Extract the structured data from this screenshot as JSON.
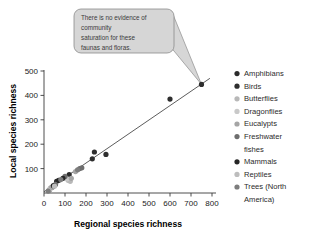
{
  "figure": {
    "background_color": "#ffffff"
  },
  "callout": {
    "name": "annotation-callout",
    "lines": [
      "There is no evidence of",
      "community",
      "saturation for these",
      "faunas and floras."
    ],
    "text": "There is no evidence of community saturation for these faunas and floras.",
    "fill_color": "#d6d6d6",
    "border_color": "#8c8c8c",
    "text_color": "#3a3a3a",
    "points_to": {
      "x": 750,
      "y": 445
    }
  },
  "chart_data": {
    "type": "scatter",
    "title": "",
    "xlabel": "Regional species richness",
    "ylabel": "Local species richness",
    "xlim": [
      0,
      800
    ],
    "ylim": [
      0,
      500
    ],
    "xticks": [
      0,
      100,
      200,
      300,
      400,
      500,
      600,
      700,
      800
    ],
    "xtick_labels": [
      "0",
      "100",
      "200",
      "300",
      "400",
      "500",
      "600",
      "700",
      "800"
    ],
    "yticks": [
      100,
      200,
      300,
      400,
      500
    ],
    "ytick_labels": [
      "100",
      "200",
      "300",
      "400",
      "500"
    ],
    "grid": false,
    "legend_position": "right",
    "trendline": {
      "name": "regression-line",
      "color": "#4a4a4a",
      "x_start": 0,
      "y_start": 5,
      "x_end": 790,
      "y_end": 470
    },
    "series": [
      {
        "name": "Amphibians",
        "color": "#2b2b2b",
        "points": [
          [
            25,
            12
          ],
          [
            40,
            25
          ],
          [
            60,
            48
          ],
          [
            120,
            75
          ]
        ]
      },
      {
        "name": "Birds",
        "color": "#2e2e2e",
        "points": [
          [
            230,
            140
          ],
          [
            240,
            168
          ],
          [
            295,
            158
          ],
          [
            600,
            385
          ],
          [
            750,
            445
          ]
        ]
      },
      {
        "name": "Butterflies",
        "color": "#b8b8b8",
        "points": [
          [
            30,
            20
          ],
          [
            115,
            52
          ],
          [
            125,
            48
          ]
        ]
      },
      {
        "name": "Dragonflies",
        "color": "#c9c9c9",
        "points": [
          [
            28,
            15
          ],
          [
            110,
            58
          ]
        ]
      },
      {
        "name": "Eucalypts",
        "color": "#a5a5a5",
        "points": [
          [
            35,
            22
          ],
          [
            130,
            60
          ],
          [
            150,
            88
          ]
        ]
      },
      {
        "name": "Freshwater fishes",
        "color": "#6e6e6e",
        "points": [
          [
            55,
            35
          ],
          [
            100,
            68
          ],
          [
            170,
            100
          ],
          [
            180,
            103
          ]
        ]
      },
      {
        "name": "Mammals",
        "color": "#262626",
        "points": [
          [
            45,
            30
          ],
          [
            70,
            52
          ],
          [
            90,
            60
          ]
        ]
      },
      {
        "name": "Reptiles",
        "color": "#bdbdbd",
        "points": [
          [
            22,
            10
          ],
          [
            50,
            28
          ]
        ]
      },
      {
        "name": "Trees (North America)",
        "color": "#7d7d7d",
        "points": [
          [
            20,
            8
          ],
          [
            80,
            55
          ],
          [
            160,
            95
          ]
        ]
      }
    ]
  },
  "legend": {
    "name": "legend",
    "items": [
      {
        "label": "Amphibians",
        "color": "#2b2b2b"
      },
      {
        "label": "Birds",
        "color": "#2e2e2e"
      },
      {
        "label": "Butterflies",
        "color": "#b8b8b8"
      },
      {
        "label": "Dragonflies",
        "color": "#c9c9c9"
      },
      {
        "label": "Eucalypts",
        "color": "#a5a5a5"
      },
      {
        "label": "Freshwater",
        "color": "#6e6e6e"
      },
      {
        "label": "fishes",
        "color": null
      },
      {
        "label": "Mammals",
        "color": "#262626"
      },
      {
        "label": "Reptiles",
        "color": "#bdbdbd"
      },
      {
        "label": "Trees (North",
        "color": "#7d7d7d"
      },
      {
        "label": "America)",
        "color": null
      }
    ]
  }
}
